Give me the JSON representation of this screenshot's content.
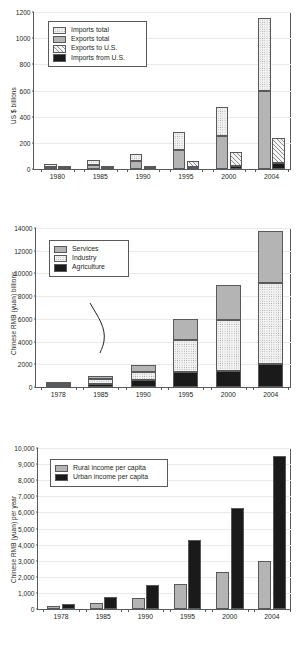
{
  "figures": [
    {
      "id": "china-trade",
      "ylabel": "US $ billions",
      "chart_data": {
        "type": "bar",
        "title": "",
        "xlabel": "",
        "ylabel": "US $ billions",
        "ylim": [
          0,
          1200
        ],
        "yticks": [
          0,
          200,
          400,
          600,
          800,
          1000,
          1200
        ],
        "ytick_labels": [
          "0",
          "200",
          "400",
          "600",
          "800",
          "1000",
          "1200"
        ],
        "grid": true,
        "legend_position": "upper left",
        "categories": [
          "1980",
          "1985",
          "1990",
          "1995",
          "2000",
          "2004"
        ],
        "groups": [
          {
            "name": "Total trade",
            "stack": [
              "Exports total",
              "Imports total"
            ],
            "series": [
              {
                "name": "Exports total",
                "values": [
                  18,
                  27,
                  62,
                  149,
                  249,
                  593
                ]
              },
              {
                "name": "Imports total",
                "values": [
                  20,
                  42,
                  53,
                  132,
                  225,
                  561
                ]
              }
            ]
          },
          {
            "name": "Trade with U.S.",
            "stack": [
              "Imports from U.S.",
              "Exports to U.S."
            ],
            "series": [
              {
                "name": "Imports from U.S.",
                "values": [
                  4,
                  4,
                  5,
                  16,
                  22,
                  44
                ]
              },
              {
                "name": "Exports to U.S.",
                "values": [
                  1,
                  3,
                  16,
                  46,
                  107,
                  196
                ]
              }
            ]
          }
        ]
      },
      "legend": [
        {
          "label": "Imports total",
          "fill": "dots"
        },
        {
          "label": "Exports total",
          "fill": "solidgray"
        },
        {
          "label": "Exports to U.S.",
          "fill": "hatch"
        },
        {
          "label": "Imports from U.S.",
          "fill": "black"
        }
      ]
    },
    {
      "id": "china-gdp-sector",
      "ylabel": "Chinese RMB (yuan) billions",
      "chart_data": {
        "type": "bar",
        "title": "",
        "xlabel": "",
        "ylabel": "Chinese RMB (yuan) billions",
        "ylim": [
          0,
          14000
        ],
        "yticks": [
          0,
          2000,
          4000,
          6000,
          8000,
          10000,
          12000,
          14000
        ],
        "ytick_labels": [
          "0",
          "2000",
          "4000",
          "6000",
          "8000",
          "10000",
          "12000",
          "14000"
        ],
        "grid": true,
        "legend_position": "upper left",
        "stacked": true,
        "categories": [
          "1978",
          "1985",
          "1990",
          "1995",
          "2000",
          "2004"
        ],
        "series": [
          {
            "name": "Agriculture",
            "values": [
              100,
              280,
              600,
              1300,
              1450,
              2000
            ]
          },
          {
            "name": "Industry",
            "values": [
              170,
              420,
              750,
              2850,
              4450,
              7200
            ]
          },
          {
            "name": "Services",
            "values": [
              90,
              250,
              560,
              1850,
              3100,
              4500
            ]
          }
        ],
        "totals": [
          360,
          950,
          1910,
          6000,
          9000,
          13700
        ]
      },
      "legend": [
        {
          "label": "Services",
          "fill": "solidgray"
        },
        {
          "label": "Industry",
          "fill": "dots"
        },
        {
          "label": "Agriculture",
          "fill": "black"
        }
      ]
    },
    {
      "id": "china-income",
      "ylabel": "Chinese RMB (yuan) per year",
      "chart_data": {
        "type": "bar",
        "title": "",
        "xlabel": "",
        "ylabel": "Chinese RMB (yuan) per year",
        "ylim": [
          0,
          10000
        ],
        "yticks": [
          0,
          1000,
          2000,
          3000,
          4000,
          5000,
          6000,
          7000,
          8000,
          9000,
          10000
        ],
        "ytick_labels": [
          "0",
          "1,000",
          "2,000",
          "3,000",
          "4,000",
          "5,000",
          "6,000",
          "7,000",
          "8,000",
          "9,000",
          "10,000"
        ],
        "grid": true,
        "legend_position": "upper left",
        "grouped": true,
        "categories": [
          "1978",
          "1985",
          "1990",
          "1995",
          "2000",
          "2004"
        ],
        "series": [
          {
            "name": "Rural income per capita",
            "values": [
              160,
              400,
              690,
              1580,
              2280,
              3000
            ]
          },
          {
            "name": "Urban income per capita",
            "values": [
              340,
              740,
              1510,
              4280,
              6300,
              9500
            ]
          }
        ]
      },
      "legend": [
        {
          "label": "Rural income per capita",
          "fill": "solidgray"
        },
        {
          "label": "Urban income per capita",
          "fill": "black"
        }
      ]
    }
  ],
  "colors": {
    "axis": "#58595b",
    "grid": "#e9e9ea",
    "solid_gray": "#b4b4b4",
    "black": "#1a1a1a",
    "text": "#231f20"
  }
}
